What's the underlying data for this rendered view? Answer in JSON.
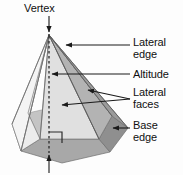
{
  "figure": {
    "shape": "hexagonal pyramid",
    "background_color": "#fdfdfd"
  },
  "labels": {
    "vertex": "Vertex",
    "lateral_edge": "Lateral\nedge",
    "altitude": "Altitude",
    "lateral_faces": "Lateral\nfaces",
    "base_edge": "Base\nedge"
  },
  "colors": {
    "text": "#101010",
    "stroke": "#4a4a4a",
    "face_left_light": "#f2f2f2",
    "face_left_mid": "#e6e6e6",
    "face_front_light": "#dedede",
    "face_right_mid": "#b5b5b5",
    "face_right_dark": "#9a9a9a",
    "base_front": "#a8a8a8",
    "base_right": "#8f8f8f",
    "base_left": "#cfcfcf",
    "leader_line": "#1a1a1a"
  },
  "annotations": {
    "right_angle_marker": "right-angle-symbol",
    "altitude_style": "dashed-vertical-line",
    "arrow_count": 6
  }
}
